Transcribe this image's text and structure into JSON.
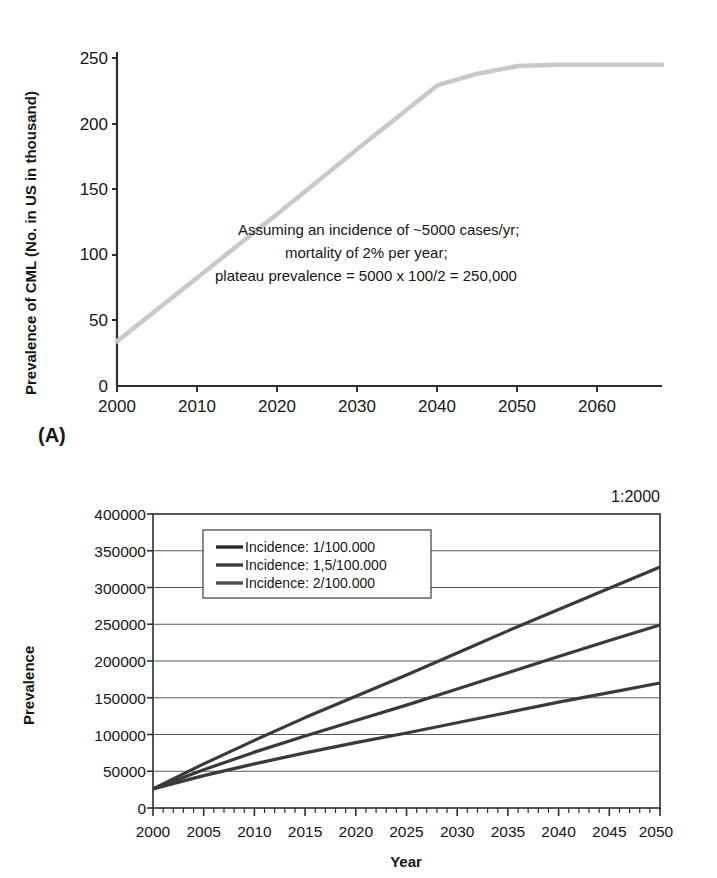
{
  "figure": {
    "panels": [
      {
        "letter": "(A)",
        "y_axis_label": "Prevalence of CML (No. in US in thousand)",
        "annotation_lines": [
          "Assuming an incidence of ~5000 cases/yr;",
          "mortality of 2% per year;",
          "plateau prevalence = 5000 x 100/2 = 250,000"
        ]
      },
      {
        "letter": "(B)",
        "corner_label": "1:2000",
        "y_axis_label": "Prevalence",
        "x_axis_label": "Year"
      }
    ]
  },
  "chart_data": [
    {
      "type": "line",
      "panel": "A",
      "title": "",
      "xlabel": "",
      "ylabel": "Prevalence of CML (No. in US in thousand)",
      "xlim": [
        2000,
        2068
      ],
      "ylim": [
        0,
        262
      ],
      "xticks": [
        2000,
        2010,
        2020,
        2030,
        2040,
        2050,
        2060
      ],
      "xtick_labels": [
        "2000",
        "2010",
        "2020",
        "2030",
        "2040",
        "2050",
        "2060"
      ],
      "yticks": [
        0,
        50,
        100,
        150,
        200,
        250
      ],
      "ytick_labels": [
        "0",
        "50",
        "100",
        "150",
        "200",
        "250"
      ],
      "grid": false,
      "legend": "none",
      "annotations": [
        "Assuming an incidence of ~5000 cases/yr;",
        "mortality of 2% per year;",
        "plateau prevalence = 5000 x 100/2 = 250,000"
      ],
      "line_color": "#c9c9c9",
      "series": [
        {
          "name": "CML prevalence",
          "x": [
            2000,
            2010,
            2020,
            2030,
            2040,
            2045,
            2050,
            2055,
            2060,
            2068
          ],
          "values": [
            35,
            85,
            135,
            186,
            236,
            245,
            251,
            252,
            252,
            252
          ]
        }
      ]
    },
    {
      "type": "line",
      "panel": "B",
      "title": "",
      "xlabel": "Year",
      "ylabel": "Prevalence",
      "corner_label": "1:2000",
      "xlim": [
        2000,
        2050
      ],
      "ylim": [
        0,
        400000
      ],
      "xticks": [
        2000,
        2005,
        2010,
        2015,
        2020,
        2025,
        2030,
        2035,
        2040,
        2045,
        2050
      ],
      "xtick_labels": [
        "2000",
        "2005",
        "2010",
        "2015",
        "2020",
        "2025",
        "2030",
        "2035",
        "2040",
        "2045",
        "2050"
      ],
      "yticks": [
        0,
        50000,
        100000,
        150000,
        200000,
        250000,
        300000,
        350000,
        400000
      ],
      "ytick_labels": [
        "0",
        "50000",
        "100000",
        "150000",
        "200000",
        "250000",
        "300000",
        "350000",
        "400000"
      ],
      "grid": true,
      "legend": "upper-left-inside",
      "line_color": "#3a3a3a",
      "x": [
        2000,
        2005,
        2010,
        2015,
        2020,
        2025,
        2030,
        2035,
        2040,
        2045,
        2050
      ],
      "series": [
        {
          "name": "Incidence: 1/100.000",
          "values": [
            26000,
            44000,
            60000,
            75000,
            89000,
            102000,
            116000,
            130000,
            144000,
            157000,
            170000
          ]
        },
        {
          "name": "Incidence: 1,5/100.000",
          "values": [
            26000,
            52000,
            76000,
            98000,
            119000,
            140000,
            162000,
            184000,
            206000,
            228000,
            249000
          ]
        },
        {
          "name": "Incidence: 2/100.000",
          "values": [
            26000,
            60000,
            92000,
            123000,
            152000,
            181000,
            211000,
            241000,
            270000,
            299000,
            328000
          ]
        }
      ]
    }
  ],
  "legend_items": [
    "Incidence: 1/100.000",
    "Incidence: 1,5/100.000",
    "Incidence: 2/100.000"
  ]
}
